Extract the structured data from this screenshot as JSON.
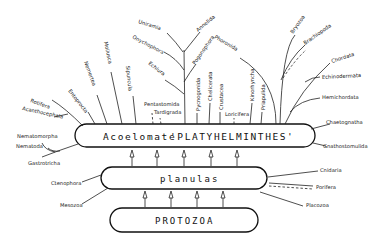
{
  "diagram": {
    "boxes": {
      "top": {
        "prefix": "Acoelomate",
        "name": "'PLATYHELMINTHES'"
      },
      "middle": {
        "name": "planulas"
      },
      "bottom": {
        "name": "PROTOZOA"
      }
    },
    "upper_taxa": [
      {
        "id": "rotifera",
        "label": "Rotifera"
      },
      {
        "id": "acanthocephala",
        "label": "Acanthocephala"
      },
      {
        "id": "entoprocta",
        "label": "Entoprocta"
      },
      {
        "id": "nemertea",
        "label": "Nemertea"
      },
      {
        "id": "mollusca",
        "label": "Mollusca"
      },
      {
        "id": "sipuncula",
        "label": "Sipuncula"
      },
      {
        "id": "pentastomida",
        "label": "Pentastomida"
      },
      {
        "id": "tardigrada",
        "label": "Tardigrada"
      },
      {
        "id": "uniramia",
        "label": "Uniramia"
      },
      {
        "id": "annelida",
        "label": "Annelida"
      },
      {
        "id": "onychophora",
        "label": "Onychophora"
      },
      {
        "id": "pogonophora",
        "label": "Pogonophora"
      },
      {
        "id": "echiura",
        "label": "Echiura"
      },
      {
        "id": "pycnogonida",
        "label": "Pycnogonida"
      },
      {
        "id": "chelicerata",
        "label": "Chelicerata"
      },
      {
        "id": "crustacea",
        "label": "Crustacea"
      },
      {
        "id": "loricifera",
        "label": "Loricifera"
      },
      {
        "id": "kinorhyncha",
        "label": "Kinorhyncha"
      },
      {
        "id": "priapulida",
        "label": "Priapulida"
      },
      {
        "id": "phoronida",
        "label": "Phoronida"
      },
      {
        "id": "bryozoa",
        "label": "Bryozoa"
      },
      {
        "id": "brachiopoda",
        "label": "Brachiopoda"
      },
      {
        "id": "chordata",
        "label": "Chordata"
      },
      {
        "id": "echinodermata",
        "label": "Echinodermata"
      },
      {
        "id": "hemichordata",
        "label": "Hemichordata"
      },
      {
        "id": "chaetognatha",
        "label": "Chaetognatha"
      },
      {
        "id": "gnathostomulida",
        "label": "Gnathostomulida"
      }
    ],
    "left_taxa": [
      {
        "id": "nematomorpha",
        "label": "Nematomorpha"
      },
      {
        "id": "nematoda",
        "label": "Nematoda"
      },
      {
        "id": "gastrotricha",
        "label": "Gastrotricha"
      },
      {
        "id": "ctenophora",
        "label": "Ctenophora"
      },
      {
        "id": "mesozoa",
        "label": "Mesozoa"
      }
    ],
    "right_taxa": [
      {
        "id": "cnidaria",
        "label": "Cnidaria"
      },
      {
        "id": "porifera",
        "label": "Porifera"
      },
      {
        "id": "placozoa",
        "label": "Placozoa"
      }
    ]
  }
}
